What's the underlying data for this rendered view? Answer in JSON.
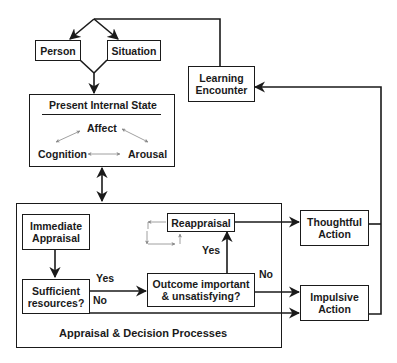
{
  "diagram": {
    "nodes": {
      "person": "Person",
      "situation": "Situation",
      "learning_encounter": "Learning Encounter",
      "present_internal_state": {
        "title": "Present Internal State",
        "affect": "Affect",
        "cognition": "Cognition",
        "arousal": "Arousal"
      },
      "appraisal_decision": {
        "title": "Appraisal & Decision Processes",
        "immediate_appraisal": "Immediate Appraisal",
        "sufficient_resources": "Sufficient resources?",
        "outcome_question": "Outcome important & unsatisfying?",
        "reappraisal": "Reappraisal"
      },
      "thoughtful_action": "Thoughtful Action",
      "impulsive_action": "Impulsive Action"
    },
    "edge_labels": {
      "sufficient_yes": "Yes",
      "sufficient_no": "No",
      "outcome_yes": "Yes",
      "outcome_no": "No"
    }
  }
}
